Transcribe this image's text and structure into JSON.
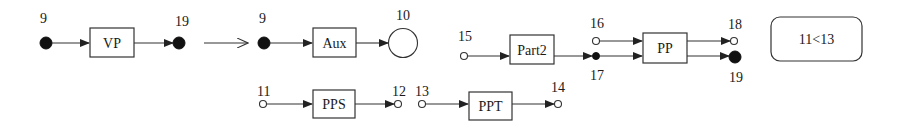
{
  "diagram": {
    "rules": [
      {
        "id": "vp",
        "box_label": "VP",
        "input_node": {
          "label": "9",
          "type": "filled"
        },
        "output_node": {
          "label": "19",
          "type": "filled"
        }
      },
      {
        "id": "aux",
        "box_label": "Aux",
        "input_node": {
          "label": "9",
          "type": "filled"
        },
        "output_node": {
          "label": "10",
          "type": "large-open-circle"
        }
      },
      {
        "id": "part2",
        "box_label": "Part2",
        "input_node": {
          "label": "15",
          "type": "open"
        },
        "output_node": {
          "label": "17",
          "type": "small-filled"
        }
      },
      {
        "id": "pp",
        "box_label": "PP",
        "input_nodes": [
          {
            "label": "16",
            "type": "open"
          },
          {
            "label": "17",
            "type": "small-filled"
          }
        ],
        "output_nodes": [
          {
            "label": "18",
            "type": "open"
          },
          {
            "label": "19",
            "type": "filled"
          }
        ]
      },
      {
        "id": "pps",
        "box_label": "PPS",
        "input_node": {
          "label": "11",
          "type": "open"
        },
        "output_node": {
          "label": "12",
          "type": "open"
        }
      },
      {
        "id": "ppt",
        "box_label": "PPT",
        "input_node": {
          "label": "13",
          "type": "open"
        },
        "output_node": {
          "label": "14",
          "type": "open"
        }
      }
    ],
    "constraint": {
      "label": "11<13"
    },
    "transform_arrow": {
      "label": ""
    },
    "colors": {
      "stroke": "#333333",
      "fill": "#111111",
      "background": "#ffffff"
    }
  }
}
